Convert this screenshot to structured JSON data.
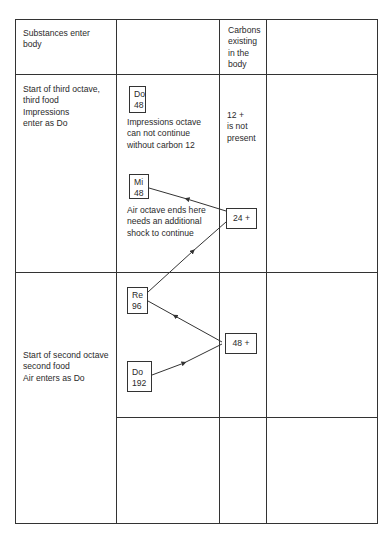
{
  "table": {
    "headers": [
      "Substances enter\nbody",
      "",
      "Carbons\nexisting\nin the\nbody",
      ""
    ],
    "rows": [
      {
        "col1": "Start of third octave,\nthird food\nImpressions\nenter as Do",
        "col3": "12 +\nis not\npresent"
      },
      {
        "col1": "Start of second octave\nsecond food\nAir enters as Do"
      },
      {}
    ]
  },
  "notes": [
    {
      "id": "do-48",
      "label": "Do\n48"
    },
    {
      "id": "mi-48",
      "label": "Mi\n48"
    },
    {
      "id": "re-96",
      "label": "Re\n96"
    },
    {
      "id": "do-192",
      "label": "Do\n192"
    }
  ],
  "carbons": [
    {
      "id": "carbon-24",
      "label": "24 +"
    },
    {
      "id": "carbon-48",
      "label": "48 +"
    }
  ],
  "annotations": {
    "impressions": "Impressions octave\ncan not continue\nwithout carbon 12",
    "air": "Air octave ends here\nneeds an additional\nshock to continue"
  },
  "colors": {
    "line": "#333333",
    "text": "#2a2a2a",
    "background": "#ffffff"
  }
}
